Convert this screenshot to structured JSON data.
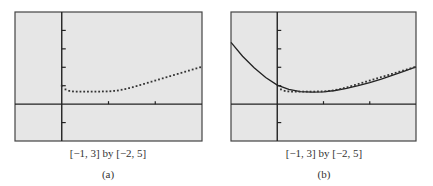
{
  "chart_data": [
    {
      "type": "scatter",
      "panel_label": "(a)",
      "window_caption": "[−1, 3] by [−2, 5]",
      "xlim": [
        -1,
        3
      ],
      "ylim": [
        -2,
        5
      ],
      "xscl": 1,
      "yscl": 1,
      "grid": false,
      "background": "#e6e6e6",
      "series": [
        {
          "name": "dotted-graph",
          "style": "dotted",
          "x": [
            0.0,
            0.08,
            0.16,
            0.24,
            0.32,
            0.4,
            0.48,
            0.56,
            0.64,
            0.72,
            0.8,
            0.88,
            0.96,
            1.04,
            1.12,
            1.2,
            1.28,
            1.36,
            1.44,
            1.52,
            1.6,
            1.68,
            1.76,
            1.84,
            1.92,
            2.0,
            2.08,
            2.16,
            2.24,
            2.32,
            2.4,
            2.48,
            2.56,
            2.64,
            2.72,
            2.8,
            2.88,
            2.96
          ],
          "y": [
            1.0,
            0.8,
            0.72,
            0.69,
            0.68,
            0.68,
            0.68,
            0.68,
            0.68,
            0.68,
            0.68,
            0.69,
            0.69,
            0.7,
            0.72,
            0.74,
            0.78,
            0.82,
            0.87,
            0.92,
            0.98,
            1.04,
            1.1,
            1.16,
            1.22,
            1.28,
            1.34,
            1.4,
            1.46,
            1.52,
            1.58,
            1.64,
            1.7,
            1.76,
            1.82,
            1.88,
            1.94,
            2.0
          ]
        }
      ]
    },
    {
      "type": "line",
      "panel_label": "(b)",
      "window_caption": "[−1, 3] by [−2, 5]",
      "xlim": [
        -1,
        3
      ],
      "ylim": [
        -2,
        5
      ],
      "xscl": 1,
      "yscl": 1,
      "grid": false,
      "background": "#e6e6e6",
      "series": [
        {
          "name": "solid-graph",
          "style": "solid",
          "x": [
            -1.0,
            -0.75,
            -0.5,
            -0.25,
            0.0,
            0.25,
            0.5,
            0.75,
            1.0,
            1.25,
            1.5,
            1.75,
            2.0,
            2.25,
            2.5,
            2.75,
            3.0
          ],
          "y": [
            3.35,
            2.6,
            1.98,
            1.45,
            1.03,
            0.8,
            0.68,
            0.65,
            0.67,
            0.74,
            0.86,
            1.0,
            1.17,
            1.36,
            1.57,
            1.79,
            2.02
          ]
        },
        {
          "name": "dotted-graph",
          "style": "dotted",
          "x": [
            0.08,
            0.16,
            0.24,
            0.32,
            0.4,
            0.48,
            0.56,
            0.64,
            0.72,
            0.8,
            0.88,
            0.96,
            1.04,
            1.12,
            1.2,
            1.28,
            1.36,
            1.44,
            1.52,
            1.6,
            1.68,
            1.76,
            1.84,
            1.92,
            2.0,
            2.08,
            2.16,
            2.24,
            2.32,
            2.4,
            2.48,
            2.56,
            2.64,
            2.72,
            2.8,
            2.88,
            2.96
          ],
          "y": [
            0.8,
            0.72,
            0.69,
            0.68,
            0.68,
            0.68,
            0.68,
            0.68,
            0.68,
            0.68,
            0.69,
            0.69,
            0.7,
            0.72,
            0.74,
            0.78,
            0.82,
            0.87,
            0.92,
            0.98,
            1.04,
            1.1,
            1.16,
            1.22,
            1.28,
            1.34,
            1.4,
            1.46,
            1.52,
            1.58,
            1.64,
            1.7,
            1.76,
            1.82,
            1.88,
            1.94,
            2.0
          ]
        }
      ]
    }
  ]
}
